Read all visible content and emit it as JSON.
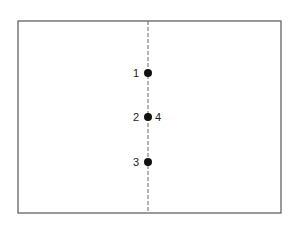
{
  "diagram": {
    "frame": {
      "x1": 18,
      "y1": 21,
      "x2": 281,
      "y2": 213
    },
    "axis": {
      "x": 148,
      "style": "dashed"
    },
    "points": [
      {
        "id": "1",
        "x": 148,
        "y": 73,
        "labels": [
          {
            "text": "1",
            "side": "left"
          }
        ]
      },
      {
        "id": "2-4",
        "x": 148,
        "y": 117,
        "labels": [
          {
            "text": "2",
            "side": "left"
          },
          {
            "text": "4",
            "side": "right"
          }
        ]
      },
      {
        "id": "3",
        "x": 148,
        "y": 162,
        "labels": [
          {
            "text": "3",
            "side": "left"
          }
        ]
      }
    ],
    "colors": {
      "line": "#555555",
      "point": "#111111"
    }
  }
}
